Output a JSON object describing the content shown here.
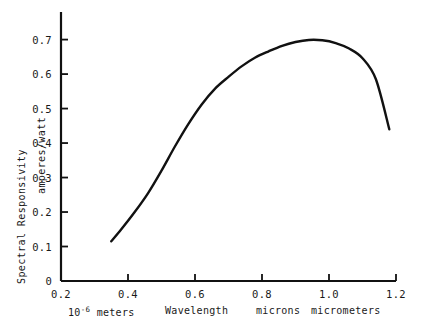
{
  "chart_data": {
    "type": "line",
    "title": "",
    "subtitle": "",
    "xlabel": "Wavelength",
    "ylabel": "Spectral Responsivity",
    "ylabel_secondary": "amperes/watt",
    "xlabel_units_left": "10",
    "xlabel_units_left_exp": "-6",
    "xlabel_units_left_word": "meters",
    "xlabel_units_mid": "microns",
    "xlabel_units_right": "micrometers",
    "xlim": [
      0.2,
      1.2
    ],
    "ylim": [
      0.0,
      0.78
    ],
    "grid": false,
    "legend": "none",
    "xticks": [
      0.2,
      0.4,
      0.6,
      0.8,
      1.0,
      1.2
    ],
    "xtick_labels": [
      "0.2",
      "0.4",
      "0.6",
      "0.8",
      "1.0",
      "1.2"
    ],
    "yticks": [
      0,
      0.1,
      0.2,
      0.3,
      0.4,
      0.5,
      0.6,
      0.7
    ],
    "ytick_labels": [
      "0",
      "0.1",
      "0.2",
      "0.3",
      "0.4",
      "0.5",
      "0.6",
      "0.7"
    ],
    "series": [
      {
        "name": "Spectral Responsivity",
        "color": "#111111",
        "x": [
          0.35,
          0.38,
          0.42,
          0.46,
          0.5,
          0.54,
          0.58,
          0.62,
          0.66,
          0.7,
          0.74,
          0.78,
          0.82,
          0.86,
          0.9,
          0.94,
          0.98,
          1.02,
          1.06,
          1.1,
          1.14,
          1.18
        ],
        "y": [
          0.115,
          0.15,
          0.2,
          0.255,
          0.32,
          0.39,
          0.455,
          0.512,
          0.558,
          0.592,
          0.623,
          0.648,
          0.666,
          0.682,
          0.693,
          0.699,
          0.698,
          0.69,
          0.674,
          0.646,
          0.585,
          0.44
        ]
      }
    ]
  },
  "axes": {
    "x_min": 0.2,
    "x_max": 1.2,
    "y_min": 0.0,
    "y_max": 0.78
  }
}
